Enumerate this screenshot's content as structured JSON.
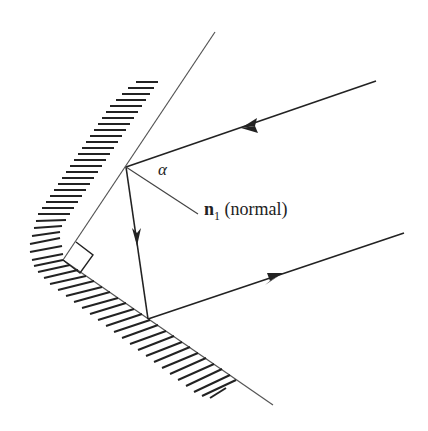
{
  "diagram": {
    "labels": {
      "angle": "α",
      "normal_vector": "n",
      "normal_subscript": "1",
      "normal_text": " (normal)"
    },
    "elements": {
      "mirror_1": "upper mirror surface with hatching",
      "mirror_2": "lower mirror surface with hatching",
      "right_angle_marker": "right angle at corner between mirrors",
      "incident_ray": "incoming ray from upper right toward upper mirror",
      "internal_ray": "ray between the two mirrors",
      "reflected_ray": "outgoing ray toward right, parallel to incident ray",
      "normal_line": "normal to upper mirror at point of incidence"
    },
    "colors": {
      "line": "#222222",
      "background": "#ffffff"
    }
  }
}
